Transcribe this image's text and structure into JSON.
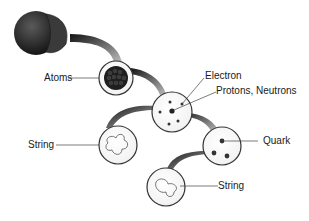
{
  "diagram": {
    "nodes": [
      {
        "id": "matter",
        "label": ""
      },
      {
        "id": "atoms",
        "label": "Atoms"
      },
      {
        "id": "atom",
        "labels": [
          "Electron",
          "Protons, Neutrons"
        ]
      },
      {
        "id": "string1",
        "label": "String"
      },
      {
        "id": "nucleon",
        "label": "Quark"
      },
      {
        "id": "string2",
        "label": "String"
      }
    ]
  },
  "labels": {
    "atoms": "Atoms",
    "electron": "Electron",
    "protons_neutrons": "Protons, Neutrons",
    "string_left": "String",
    "quark": "Quark",
    "string_bottom": "String"
  },
  "colors": {
    "sphere": "#2a2a2a",
    "connector": "#3a3a3a",
    "circle_stroke": "#333333",
    "text": "#1a1a1a"
  }
}
